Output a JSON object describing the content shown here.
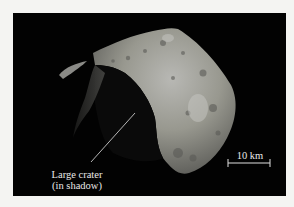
{
  "figure": {
    "annotation": {
      "line1": "Large crater",
      "line2": "(in shadow)"
    },
    "scale_bar": {
      "label": "10 km"
    },
    "colors": {
      "background": "#f4f4f2",
      "space": "#020202",
      "asteroid_light": "#a9a9a5",
      "asteroid_mid": "#7c7c78",
      "asteroid_dark": "#3a3a38",
      "annotation": "#e8e8e8"
    }
  }
}
